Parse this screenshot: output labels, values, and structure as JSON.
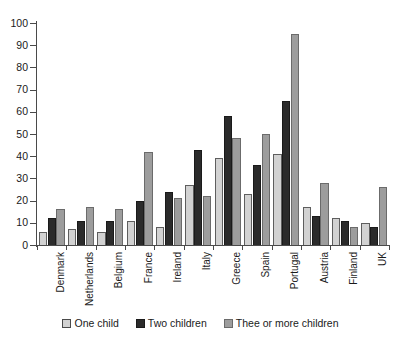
{
  "chart_data": {
    "type": "bar",
    "title": "",
    "xlabel": "",
    "ylabel": "",
    "ylim": [
      0,
      100
    ],
    "ytick_step": 10,
    "yticks": [
      0,
      10,
      20,
      30,
      40,
      50,
      60,
      70,
      80,
      90,
      100
    ],
    "ytick_labels": [
      "0",
      "10",
      "20",
      "30",
      "40",
      "50",
      "60",
      "70",
      "80",
      "90",
      "100"
    ],
    "grid": false,
    "legend_position": "bottom",
    "categories": [
      "Denmark",
      "Netherlands",
      "Belgium",
      "France",
      "Ireland",
      "Italy",
      "Greece",
      "Spain",
      "Portugal",
      "Austria",
      "Finland",
      "UK"
    ],
    "series": [
      {
        "name": "One child",
        "color": "#d2d2d2",
        "values": [
          6,
          7,
          6,
          11,
          8,
          27,
          39,
          23,
          41,
          17,
          12,
          10
        ]
      },
      {
        "name": "Two children",
        "color": "#2b2b2b",
        "values": [
          12,
          11,
          11,
          20,
          24,
          43,
          58,
          36,
          65,
          13,
          11,
          8
        ]
      },
      {
        "name": "Thee or more children",
        "color": "#9d9d9d",
        "values": [
          16,
          17,
          16,
          42,
          21,
          22,
          48,
          50,
          95,
          28,
          8,
          26
        ]
      }
    ]
  },
  "legend": {
    "items": [
      {
        "label": "One child",
        "swatch": "legend-swatch-one-child"
      },
      {
        "label": "Two children",
        "swatch": "legend-swatch-two-children"
      },
      {
        "label": "Thee or more children",
        "swatch": "legend-swatch-three-or-more-children"
      }
    ]
  }
}
